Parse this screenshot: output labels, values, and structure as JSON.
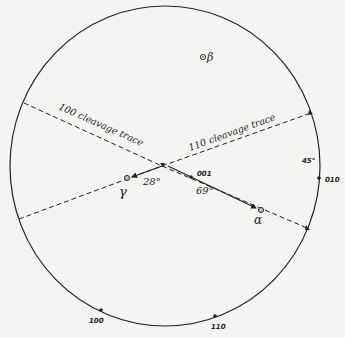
{
  "diagram": {
    "type": "stereographic-projection",
    "primitive_circle": {
      "cx": 165,
      "cy": 166,
      "rx": 155,
      "ry": 160
    },
    "traces": [
      {
        "id": "trace-100",
        "label": "100 cleavage trace",
        "from": [
          24,
          103
        ],
        "to": [
          19,
          219
        ]
      },
      {
        "id": "trace-110",
        "label": "110 cleavage trace",
        "from": [
          311,
          113
        ],
        "to": [
          307,
          228
        ]
      }
    ],
    "intersection": [
      162,
      166
    ],
    "points": {
      "beta": {
        "symbol": "β",
        "x": 203,
        "y": 57
      },
      "gamma": {
        "symbol": "γ",
        "x": 127,
        "y": 178
      },
      "alpha": {
        "symbol": "α",
        "x": 261,
        "y": 210
      },
      "pole_001": {
        "label": "001",
        "x": 191,
        "y": 177
      }
    },
    "angles": {
      "gamma_angle": "28°",
      "alpha_angle": "69°",
      "rim_angle": "45°"
    },
    "rim_poles": [
      {
        "label": "010",
        "x": 319,
        "y": 178
      },
      {
        "label": "100",
        "x": 101,
        "y": 310
      },
      {
        "label": "110",
        "x": 215,
        "y": 316
      }
    ]
  }
}
